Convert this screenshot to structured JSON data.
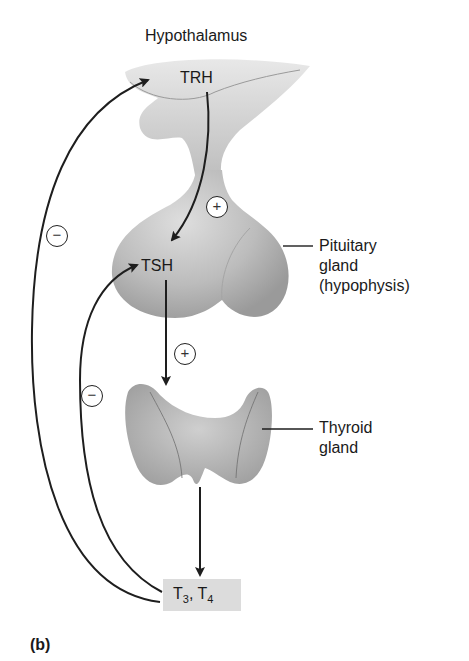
{
  "diagram": {
    "title_labels": {
      "hypothalamus": "Hypothalamus",
      "pituitary_line1": "Pituitary",
      "pituitary_line2": "gland",
      "pituitary_line3": "(hypophysis)",
      "thyroid_line1": "Thyroid",
      "thyroid_line2": "gland"
    },
    "hormones": {
      "trh": "TRH",
      "tsh": "TSH",
      "t_box": {
        "t3_letter": "T",
        "t3_sub": "3",
        "sep": ", ",
        "t4_letter": "T",
        "t4_sub": "4"
      }
    },
    "signs": {
      "trh_to_tsh": "+",
      "tsh_to_thyroid": "+",
      "t34_to_trh": "−",
      "t34_to_tsh": "−"
    },
    "panel_label": "(b)",
    "colors": {
      "tissue": "#b8b8b8",
      "tissue_light": "#d6d6d6",
      "tissue_dark": "#8f8f8f",
      "arrow": "#1e1e1e",
      "box": "#dcdcdc"
    }
  }
}
